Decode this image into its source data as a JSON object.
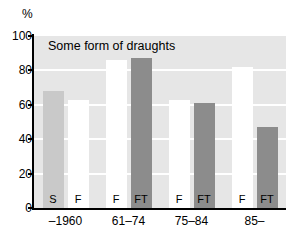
{
  "chart_data": {
    "type": "bar",
    "title": "Some form of draughts",
    "xlabel": "",
    "ylabel": "%",
    "ylim": [
      0,
      100
    ],
    "yticks": [
      0,
      20,
      40,
      60,
      80,
      100
    ],
    "grid": true,
    "legend": "none",
    "categories": [
      "–1960",
      "61–74",
      "75–84",
      "85–"
    ],
    "groups": [
      {
        "category": "–1960",
        "bars": [
          {
            "series": "S",
            "label": "S",
            "value": 68,
            "color": "#c9c9c9"
          },
          {
            "series": "F",
            "label": "F",
            "value": 63,
            "color": "#ffffff"
          }
        ]
      },
      {
        "category": "61–74",
        "bars": [
          {
            "series": "F",
            "label": "F",
            "value": 86,
            "color": "#ffffff"
          },
          {
            "series": "FT",
            "label": "FT",
            "value": 87,
            "color": "#8c8c8c"
          }
        ]
      },
      {
        "category": "75–84",
        "bars": [
          {
            "series": "F",
            "label": "F",
            "value": 63,
            "color": "#ffffff"
          },
          {
            "series": "FT",
            "label": "FT",
            "value": 61,
            "color": "#8c8c8c"
          }
        ]
      },
      {
        "category": "85–",
        "bars": [
          {
            "series": "F",
            "label": "F",
            "value": 82,
            "color": "#ffffff"
          },
          {
            "series": "FT",
            "label": "FT",
            "value": 47,
            "color": "#8c8c8c"
          }
        ]
      }
    ],
    "series_names": [
      "S",
      "F",
      "FT"
    ],
    "colors": {
      "plot_background": "#e6e6e6",
      "gridline": "#ffffff",
      "axis": "#000000",
      "bar_s": "#c9c9c9",
      "bar_f": "#ffffff",
      "bar_ft": "#8c8c8c"
    }
  }
}
